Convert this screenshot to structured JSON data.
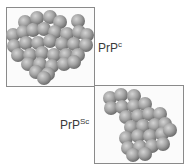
{
  "labels": {
    "native": {
      "base": "PrP",
      "sup": "c"
    },
    "scrapie": {
      "base": "PrP",
      "sup": "Sc"
    }
  },
  "colors": {
    "sphere_light": "#d4d4d4",
    "sphere_mid": "#a3a3a3",
    "sphere_dark": "#6e6e6e",
    "frame": "#8a8a8a"
  },
  "molecules": {
    "native": {
      "radius": 7,
      "spheres": [
        [
          25,
          22
        ],
        [
          37,
          18
        ],
        [
          50,
          17
        ],
        [
          60,
          22
        ],
        [
          78,
          21
        ],
        [
          13,
          35
        ],
        [
          23,
          32
        ],
        [
          33,
          30
        ],
        [
          44,
          29
        ],
        [
          55,
          32
        ],
        [
          67,
          34
        ],
        [
          79,
          32
        ],
        [
          87,
          35
        ],
        [
          14,
          46
        ],
        [
          26,
          43
        ],
        [
          38,
          43
        ],
        [
          50,
          41
        ],
        [
          62,
          44
        ],
        [
          74,
          44
        ],
        [
          86,
          45
        ],
        [
          18,
          55
        ],
        [
          30,
          55
        ],
        [
          42,
          53
        ],
        [
          54,
          55
        ],
        [
          66,
          55
        ],
        [
          78,
          55
        ],
        [
          28,
          64
        ],
        [
          40,
          64
        ],
        [
          52,
          66
        ],
        [
          64,
          64
        ],
        [
          74,
          62
        ],
        [
          36,
          72
        ],
        [
          48,
          74
        ],
        [
          44,
          78
        ]
      ]
    },
    "scrapie": {
      "radius": 7,
      "spheres": [
        [
          110,
          98
        ],
        [
          121,
          95
        ],
        [
          134,
          96
        ],
        [
          111,
          108
        ],
        [
          122,
          107
        ],
        [
          134,
          106
        ],
        [
          145,
          104
        ],
        [
          126,
          117
        ],
        [
          138,
          116
        ],
        [
          149,
          114
        ],
        [
          160,
          114
        ],
        [
          131,
          127
        ],
        [
          143,
          126
        ],
        [
          155,
          125
        ],
        [
          165,
          124
        ],
        [
          126,
          138
        ],
        [
          138,
          136
        ],
        [
          150,
          136
        ],
        [
          162,
          134
        ],
        [
          170,
          130
        ],
        [
          128,
          148
        ],
        [
          140,
          147
        ],
        [
          152,
          146
        ],
        [
          163,
          144
        ],
        [
          133,
          155
        ],
        [
          145,
          154
        ]
      ]
    }
  }
}
